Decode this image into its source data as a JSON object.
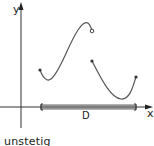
{
  "figure": {
    "axes": {
      "x_label": "x",
      "y_label": "y"
    },
    "domain_label": "D",
    "caption": "unstetig",
    "colors": {
      "axis": "#333333",
      "curve": "#555555",
      "domain_bar": "#c8c8c8"
    },
    "curves": [
      {
        "name": "left-branch",
        "start": "closed",
        "end": "open"
      },
      {
        "name": "right-branch",
        "start": "closed",
        "end": "closed"
      }
    ]
  }
}
